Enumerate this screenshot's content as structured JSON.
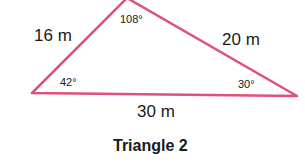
{
  "diagram": {
    "caption": "Triangle 2",
    "stroke_color": "#e0507a",
    "vertices": {
      "left": [
        32,
        93
      ],
      "top": [
        127,
        -2
      ],
      "right": [
        297,
        96
      ]
    },
    "sides": {
      "left": "16 m",
      "right": "20 m",
      "bottom": "30 m"
    },
    "angles": {
      "top": "108°",
      "left": "42°",
      "right": "30°"
    }
  }
}
